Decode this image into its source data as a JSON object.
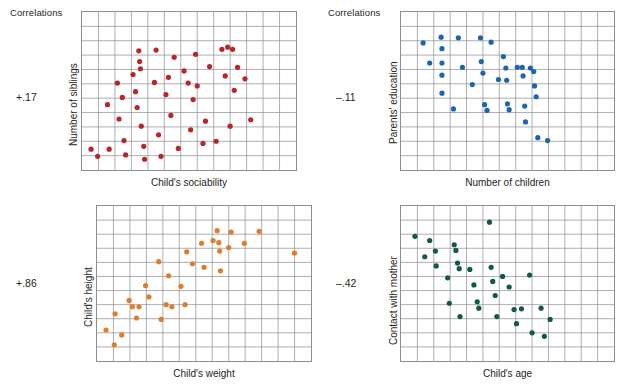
{
  "figure": {
    "width": 628,
    "height": 390,
    "background": "#ffffff",
    "grid_color": "#8d8d93"
  },
  "panels": [
    {
      "id": "siblings-vs-sociability",
      "header": "Correlations",
      "correlation": "+.17",
      "ylabel": "Number of siblings",
      "xlabel": "Child's sociability",
      "color": "#b5272d"
    },
    {
      "id": "education-vs-children",
      "header": "Correlations",
      "correlation": "–.11",
      "ylabel": "Parents' education",
      "xlabel": "Number of children",
      "color": "#1f64ae"
    },
    {
      "id": "height-vs-weight",
      "header": "",
      "correlation": "+.86",
      "ylabel": "Child's height",
      "xlabel": "Child's weight",
      "color": "#dd7d2e"
    },
    {
      "id": "contact-vs-age",
      "header": "",
      "correlation": "–.42",
      "ylabel": "Contact with mother",
      "xlabel": "Child's age",
      "color": "#14584c"
    }
  ],
  "chart_data": [
    {
      "type": "scatter",
      "id": "siblings-vs-sociability",
      "title": "Correlations",
      "annotation": "+.17",
      "correlation": 0.17,
      "xlabel": "Child's sociability",
      "ylabel": "Number of siblings",
      "color": "#b5272d",
      "xlim": [
        0,
        13
      ],
      "ylim": [
        0,
        11
      ],
      "grid": true,
      "legend": "none",
      "points": [
        [
          0.55,
          1.45
        ],
        [
          0.95,
          0.95
        ],
        [
          1.55,
          4.55
        ],
        [
          1.65,
          1.45
        ],
        [
          2.15,
          6.05
        ],
        [
          2.25,
          3.55
        ],
        [
          2.45,
          5.05
        ],
        [
          2.55,
          2.05
        ],
        [
          2.65,
          1.05
        ],
        [
          3.1,
          6.65
        ],
        [
          3.25,
          5.45
        ],
        [
          3.35,
          4.35
        ],
        [
          3.45,
          8.3
        ],
        [
          3.5,
          7.55
        ],
        [
          3.55,
          7.05
        ],
        [
          3.6,
          3.05
        ],
        [
          3.75,
          1.65
        ],
        [
          3.8,
          0.75
        ],
        [
          4.4,
          6.1
        ],
        [
          4.5,
          8.35
        ],
        [
          4.65,
          2.45
        ],
        [
          4.8,
          0.95
        ],
        [
          5.1,
          5.25
        ],
        [
          5.25,
          6.45
        ],
        [
          5.4,
          3.8
        ],
        [
          5.6,
          7.85
        ],
        [
          5.85,
          1.5
        ],
        [
          6.2,
          6.9
        ],
        [
          6.45,
          6.05
        ],
        [
          6.6,
          2.8
        ],
        [
          6.75,
          4.9
        ],
        [
          6.9,
          8.05
        ],
        [
          7.0,
          5.85
        ],
        [
          7.35,
          1.85
        ],
        [
          7.5,
          3.4
        ],
        [
          7.75,
          7.2
        ],
        [
          8.15,
          2.0
        ],
        [
          8.5,
          8.4
        ],
        [
          8.7,
          6.55
        ],
        [
          8.85,
          8.55
        ],
        [
          9.0,
          3.05
        ],
        [
          9.15,
          8.4
        ],
        [
          9.25,
          5.55
        ],
        [
          9.45,
          7.15
        ],
        [
          9.9,
          6.35
        ],
        [
          10.25,
          3.5
        ]
      ]
    },
    {
      "type": "scatter",
      "id": "education-vs-children",
      "title": "Correlations",
      "annotation": "–.11",
      "correlation": -0.11,
      "xlabel": "Number of children",
      "ylabel": "Parents' education",
      "color": "#1f64ae",
      "xlim": [
        0,
        13
      ],
      "ylim": [
        0,
        11
      ],
      "grid": true,
      "legend": "none",
      "points": [
        [
          1.35,
          8.85
        ],
        [
          1.75,
          7.45
        ],
        [
          2.45,
          9.25
        ],
        [
          2.5,
          8.45
        ],
        [
          2.5,
          7.45
        ],
        [
          2.5,
          6.6
        ],
        [
          2.5,
          5.35
        ],
        [
          3.2,
          4.25
        ],
        [
          3.5,
          9.2
        ],
        [
          3.75,
          7.15
        ],
        [
          4.35,
          5.95
        ],
        [
          4.85,
          9.2
        ],
        [
          4.9,
          7.55
        ],
        [
          5.0,
          6.75
        ],
        [
          5.1,
          4.55
        ],
        [
          5.25,
          4.15
        ],
        [
          5.5,
          8.9
        ],
        [
          5.95,
          6.3
        ],
        [
          6.25,
          7.9
        ],
        [
          6.4,
          7.1
        ],
        [
          6.45,
          6.25
        ],
        [
          6.5,
          4.6
        ],
        [
          6.6,
          4.2
        ],
        [
          7.1,
          7.15
        ],
        [
          7.4,
          7.15
        ],
        [
          7.45,
          6.55
        ],
        [
          7.55,
          4.45
        ],
        [
          7.6,
          3.35
        ],
        [
          7.9,
          7.1
        ],
        [
          8.1,
          6.85
        ],
        [
          8.15,
          5.85
        ],
        [
          8.25,
          5.1
        ],
        [
          8.35,
          2.25
        ],
        [
          8.95,
          2.05
        ]
      ]
    },
    {
      "type": "scatter",
      "id": "height-vs-weight",
      "annotation": "+.86",
      "correlation": 0.86,
      "xlabel": "Child's weight",
      "ylabel": "Child's height",
      "color": "#dd7d2e",
      "xlim": [
        0,
        13
      ],
      "ylim": [
        0,
        11
      ],
      "grid": true,
      "legend": "none",
      "points": [
        [
          0.55,
          2.2
        ],
        [
          1.05,
          1.15
        ],
        [
          1.1,
          3.35
        ],
        [
          1.5,
          1.85
        ],
        [
          1.95,
          4.3
        ],
        [
          2.15,
          3.85
        ],
        [
          2.4,
          3.05
        ],
        [
          2.55,
          3.85
        ],
        [
          2.95,
          5.35
        ],
        [
          3.15,
          4.55
        ],
        [
          3.75,
          7.05
        ],
        [
          3.9,
          2.95
        ],
        [
          4.2,
          4.0
        ],
        [
          4.35,
          6.05
        ],
        [
          4.55,
          3.85
        ],
        [
          5.1,
          5.3
        ],
        [
          5.35,
          4.0
        ],
        [
          5.45,
          7.75
        ],
        [
          5.8,
          6.9
        ],
        [
          6.35,
          8.35
        ],
        [
          6.5,
          6.65
        ],
        [
          7.05,
          8.55
        ],
        [
          7.3,
          9.25
        ],
        [
          7.4,
          8.4
        ],
        [
          7.45,
          7.8
        ],
        [
          7.5,
          6.4
        ],
        [
          8.0,
          8.05
        ],
        [
          8.15,
          9.15
        ],
        [
          8.95,
          8.35
        ],
        [
          9.85,
          9.2
        ],
        [
          12.0,
          7.65
        ]
      ]
    },
    {
      "type": "scatter",
      "id": "contact-vs-age",
      "annotation": "–.42",
      "correlation": -0.42,
      "xlabel": "Child's age",
      "ylabel": "Contact with mother",
      "color": "#14584c",
      "xlim": [
        0,
        13
      ],
      "ylim": [
        0,
        11
      ],
      "grid": true,
      "legend": "none",
      "points": [
        [
          0.85,
          8.85
        ],
        [
          1.45,
          7.4
        ],
        [
          1.75,
          8.55
        ],
        [
          2.1,
          7.8
        ],
        [
          2.15,
          6.75
        ],
        [
          2.85,
          5.9
        ],
        [
          2.95,
          4.1
        ],
        [
          3.25,
          8.25
        ],
        [
          3.35,
          7.85
        ],
        [
          3.45,
          6.95
        ],
        [
          3.55,
          6.55
        ],
        [
          3.6,
          3.15
        ],
        [
          4.2,
          6.5
        ],
        [
          4.45,
          5.4
        ],
        [
          4.65,
          4.2
        ],
        [
          4.75,
          3.75
        ],
        [
          5.4,
          9.85
        ],
        [
          5.5,
          6.65
        ],
        [
          5.6,
          5.65
        ],
        [
          5.75,
          4.65
        ],
        [
          5.85,
          3.15
        ],
        [
          6.2,
          6.0
        ],
        [
          6.6,
          5.25
        ],
        [
          6.9,
          3.65
        ],
        [
          7.05,
          2.65
        ],
        [
          7.35,
          3.7
        ],
        [
          7.85,
          6.1
        ],
        [
          8.0,
          2.0
        ],
        [
          8.55,
          3.75
        ],
        [
          8.75,
          1.75
        ],
        [
          9.1,
          2.95
        ]
      ]
    }
  ]
}
